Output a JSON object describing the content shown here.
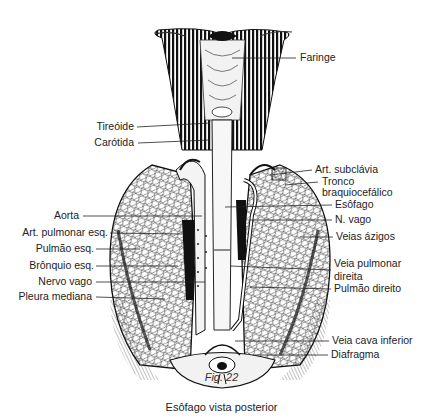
{
  "figure": {
    "number": "Fig. 22",
    "caption": "Esôfago vista posterior",
    "colors": {
      "ink": "#1a1a1a",
      "paper": "#ffffff",
      "shade": "#555555"
    }
  },
  "labels_left": [
    {
      "id": "tireoide",
      "text": "Tireóide",
      "x_right": 136,
      "y": 127,
      "line_to": 210
    },
    {
      "id": "carotida",
      "text": "Carótida",
      "x_right": 136,
      "y": 143,
      "line_to": 210
    },
    {
      "id": "aorta",
      "text": "Aorta",
      "x_right": 80,
      "y": 216,
      "line_to": 200
    },
    {
      "id": "art-pulmonar-esq",
      "text": "Art. pulmonar esq.",
      "x_right": 108,
      "y": 233,
      "line_to": 180
    },
    {
      "id": "pulmao-esq",
      "text": "Pulmão esq.",
      "x_right": 94,
      "y": 249,
      "line_to": 140
    },
    {
      "id": "bronquio-esq",
      "text": "Brônquio esq.",
      "x_right": 94,
      "y": 266,
      "line_to": 178
    },
    {
      "id": "nervo-vago",
      "text": "Nervo vago",
      "x_right": 92,
      "y": 282,
      "line_to": 205
    },
    {
      "id": "pleura-mediana",
      "text": "Pleura mediana",
      "x_right": 92,
      "y": 297,
      "line_to": 165
    }
  ],
  "labels_right": [
    {
      "id": "faringe",
      "text": "Faringe",
      "x": 300,
      "y": 58,
      "line_from": 232
    },
    {
      "id": "art-subclavia",
      "text": "Art. subclávia",
      "x": 315,
      "y": 170,
      "line_from": 270
    },
    {
      "id": "tronco-braquiocefalico",
      "text": "Tronco",
      "text2": "braquiocefálico",
      "x": 322,
      "y": 182,
      "line_from": 285
    },
    {
      "id": "esofago",
      "text": "Esôfago",
      "x": 335,
      "y": 205,
      "line_from": 225
    },
    {
      "id": "n-vago",
      "text": "N. vago",
      "x": 335,
      "y": 220,
      "line_from": 250
    },
    {
      "id": "veias-azigos",
      "text": "Veias ázigos",
      "x": 336,
      "y": 237,
      "line_from": 300
    },
    {
      "id": "veia-pulmonar-direita",
      "text": "Veia pulmonar",
      "text2": "direita",
      "x": 334,
      "y": 264,
      "line_from": 230
    },
    {
      "id": "pulmao-direito",
      "text": "Pulmão direito",
      "x": 334,
      "y": 289,
      "line_from": 250
    },
    {
      "id": "veia-cava-inferior",
      "text": "Veia cava  inferior",
      "x": 332,
      "y": 341,
      "line_from": 235
    },
    {
      "id": "diafragma",
      "text": "Diafragma",
      "x": 331,
      "y": 355,
      "line_from": 255
    }
  ]
}
